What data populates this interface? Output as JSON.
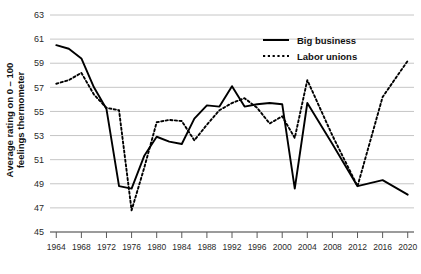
{
  "chart_data": {
    "type": "line",
    "title": "",
    "xlabel": "",
    "ylabel_line1": "Average rating on 0 – 100",
    "ylabel_line2": "feelings thermometer",
    "grid": true,
    "legend_position": "top-right",
    "xlim": [
      1963,
      2021
    ],
    "ylim": [
      45,
      63
    ],
    "ytick_values": [
      45,
      47,
      49,
      51,
      53,
      55,
      57,
      59,
      61,
      63
    ],
    "ytick_labels": [
      "45",
      "47",
      "49",
      "51",
      "53",
      "55",
      "57",
      "59",
      "61",
      "63"
    ],
    "xtick_values": [
      1964,
      1968,
      1972,
      1976,
      1980,
      1984,
      1988,
      1992,
      1996,
      2000,
      2004,
      2008,
      2012,
      2016,
      2020
    ],
    "xtick_labels": [
      "1964",
      "1968",
      "1972",
      "1976",
      "1980",
      "1984",
      "1988",
      "1992",
      "1996",
      "2000",
      "2004",
      "2008",
      "2012",
      "2016",
      "2020"
    ],
    "x": [
      1964,
      1966,
      1968,
      1970,
      1972,
      1974,
      1976,
      1978,
      1980,
      1982,
      1984,
      1986,
      1988,
      1990,
      1992,
      1994,
      1996,
      1998,
      2000,
      2002,
      2004,
      2008,
      2012,
      2016,
      2020
    ],
    "series": [
      {
        "name": "Big business",
        "style": "solid",
        "color": "#000000",
        "values": [
          60.5,
          60.2,
          59.4,
          57.0,
          55.2,
          48.8,
          48.6,
          51.3,
          52.9,
          52.5,
          52.3,
          54.4,
          55.5,
          55.4,
          57.1,
          55.4,
          55.6,
          55.7,
          55.6,
          48.6,
          55.7,
          52.3,
          48.8,
          49.3,
          48.1
        ]
      },
      {
        "name": "Labor unions",
        "style": "dotted",
        "color": "#000000",
        "values": [
          57.3,
          57.6,
          58.2,
          56.4,
          55.3,
          55.1,
          46.8,
          50.3,
          54.1,
          54.3,
          54.2,
          52.6,
          53.9,
          55.1,
          55.7,
          56.1,
          55.3,
          54.0,
          54.6,
          52.8,
          57.6,
          53.0,
          48.8,
          56.2,
          59.2
        ]
      }
    ]
  },
  "legend": {
    "items": [
      {
        "label": "Big business",
        "style": "solid"
      },
      {
        "label": "Labor unions",
        "style": "dotted"
      }
    ]
  }
}
